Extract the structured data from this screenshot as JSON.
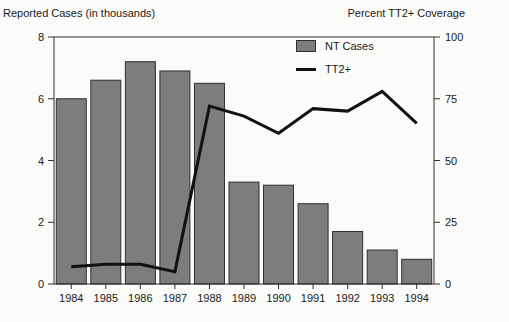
{
  "chart_data": {
    "type": "bar",
    "subtype": "bar-and-line-dual-axis",
    "left_axis_title": "Reported Cases (in thousands)",
    "right_axis_title": "Percent TT2+ Coverage",
    "categories": [
      "1984",
      "1985",
      "1986",
      "1987",
      "1988",
      "1989",
      "1990",
      "1991",
      "1992",
      "1993",
      "1994"
    ],
    "series": [
      {
        "name": "NT Cases",
        "type": "bar",
        "axis": "left",
        "values": [
          6.0,
          6.6,
          7.2,
          6.9,
          6.5,
          3.3,
          3.2,
          2.6,
          1.7,
          1.1,
          0.8
        ],
        "color": "#7d7d7d",
        "border_color": "#2e2e2e"
      },
      {
        "name": "TT2+",
        "type": "line",
        "axis": "right",
        "values": [
          7,
          8,
          8,
          5,
          72,
          68,
          61,
          71,
          70,
          78,
          65
        ],
        "color": "#111111"
      }
    ],
    "left_axis": {
      "ticks": [
        0,
        2,
        4,
        6,
        8
      ],
      "range": [
        0,
        8
      ]
    },
    "right_axis": {
      "ticks": [
        0,
        25,
        50,
        75,
        100
      ],
      "range": [
        0,
        100
      ]
    },
    "grid": "off",
    "legend_position": "top-inside-right-of-center"
  },
  "colors": {
    "background": "#fbfbf9",
    "bar_fill": "#7d7d7d",
    "bar_border": "#2e2e2e",
    "line": "#111111",
    "axis": "#2e2e2e",
    "text": "#1a1a1a"
  }
}
